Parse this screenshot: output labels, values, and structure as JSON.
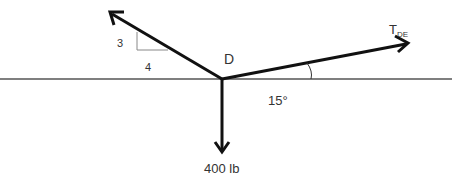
{
  "diagram": {
    "point_label": "D",
    "slope_rise": "3",
    "slope_run": "4",
    "tension_label_main": "T",
    "tension_label_sub": "DE",
    "angle_label": "15°",
    "load_label": "400 lb",
    "colors": {
      "vector": "#111111",
      "ground_line": "#555555",
      "slope_triangle": "#888888",
      "text": "#333333"
    }
  }
}
